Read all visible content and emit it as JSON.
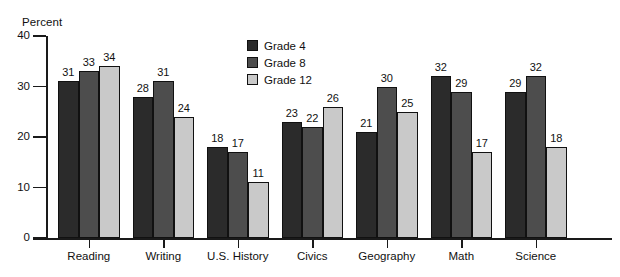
{
  "page": {
    "cut_off_caption": ""
  },
  "chart_data": {
    "type": "bar",
    "title": "",
    "xlabel": "",
    "ylabel": "Percent",
    "ylim": [
      0,
      40
    ],
    "yticks": [
      0,
      10,
      20,
      30,
      40
    ],
    "ytick_labels": [
      "0",
      "10",
      "20",
      "30",
      "40"
    ],
    "grid": false,
    "legend_position": "inside-top-center",
    "orientation": "vertical",
    "grouping": "clustered",
    "value_labels": true,
    "categories": [
      "Reading",
      "Writing",
      "U.S. History",
      "Civics",
      "Geography",
      "Math",
      "Science"
    ],
    "series": [
      {
        "name": "Grade 4",
        "color": "#2b2b2b",
        "values": [
          31,
          28,
          18,
          23,
          21,
          32,
          29
        ]
      },
      {
        "name": "Grade 8",
        "color": "#4d4d4d",
        "values": [
          33,
          31,
          17,
          22,
          30,
          29,
          32
        ]
      },
      {
        "name": "Grade 12",
        "color": "#c9c9c9",
        "values": [
          34,
          24,
          11,
          26,
          25,
          17,
          18
        ]
      }
    ]
  }
}
